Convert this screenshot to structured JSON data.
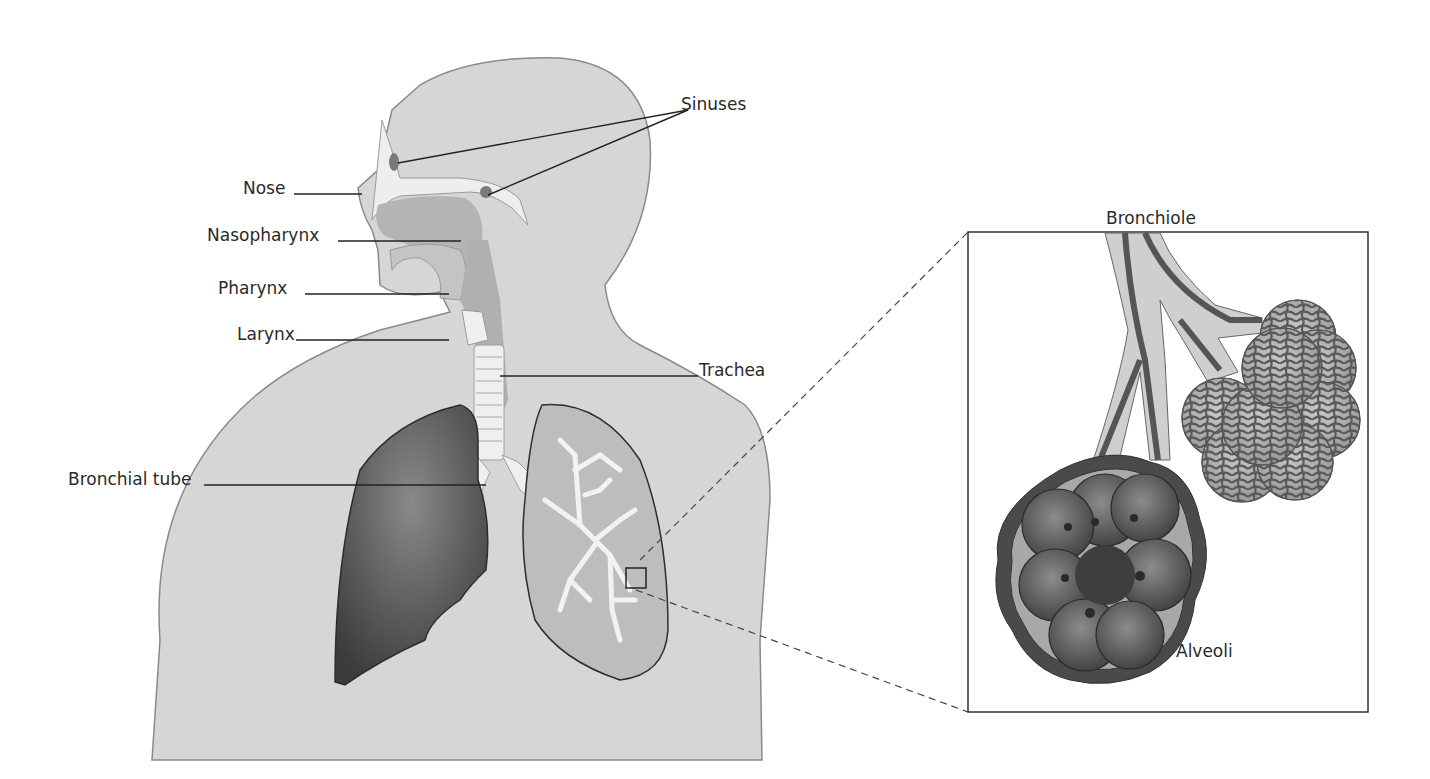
{
  "diagram": {
    "type": "anatomical-illustration",
    "labels": {
      "sinuses": "Sinuses",
      "nose": "Nose",
      "nasopharynx": "Nasopharynx",
      "pharynx": "Pharynx",
      "larynx": "Larynx",
      "trachea": "Trachea",
      "bronchial_tube": "Bronchial tube",
      "bronchiole": "Bronchiole",
      "alveoli": "Alveoli"
    },
    "inset": {
      "description": "Magnified view of bronchiole and alveoli from boxed region of left-side lung"
    },
    "colors": {
      "body": "#d6d6d6",
      "body_outline": "#8a8a8a",
      "airway_light": "#efefef",
      "airway_mid": "#b4b4b4",
      "lung_dark": "#555555",
      "lung_light": "#bdbdbd",
      "leader_line": "#222222"
    }
  }
}
